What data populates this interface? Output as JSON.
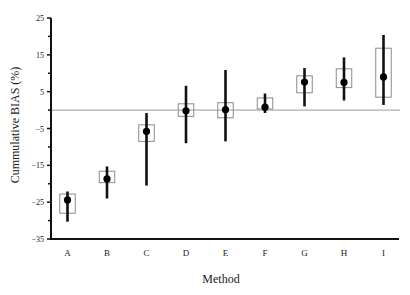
{
  "chart_data": {
    "type": "errorbar-box",
    "title": "",
    "xlabel": "Method",
    "ylabel": "Cummulative BIAS (%)",
    "ylim": [
      -35,
      25
    ],
    "yticks": [
      25,
      15,
      5,
      -5,
      -15,
      -25,
      -35
    ],
    "yticks_minor": [
      20,
      10,
      0,
      -10,
      -20,
      -30
    ],
    "reference_line": 0,
    "grid": false,
    "legend": null,
    "categories": [
      "A",
      "B",
      "C",
      "D",
      "E",
      "F",
      "G",
      "H",
      "I"
    ],
    "series": [
      {
        "name": "Cummulative BIAS",
        "points": [
          {
            "category": "A",
            "mean": -24.4,
            "box_low": -28.0,
            "box_high": -22.8,
            "whisker_low": -30.3,
            "whisker_high": -22.1
          },
          {
            "category": "B",
            "mean": -18.7,
            "box_low": -19.7,
            "box_high": -16.6,
            "whisker_low": -24.0,
            "whisker_high": -15.3
          },
          {
            "category": "C",
            "mean": -5.8,
            "box_low": -8.5,
            "box_high": -4.0,
            "whisker_low": -20.5,
            "whisker_high": -0.8
          },
          {
            "category": "D",
            "mean": -0.2,
            "box_low": -1.7,
            "box_high": 1.7,
            "whisker_low": -9.0,
            "whisker_high": 6.6
          },
          {
            "category": "E",
            "mean": 0.1,
            "box_low": -2.1,
            "box_high": 2.0,
            "whisker_low": -8.5,
            "whisker_high": 10.9
          },
          {
            "category": "F",
            "mean": 0.8,
            "box_low": 0.3,
            "box_high": 3.3,
            "whisker_low": -0.8,
            "whisker_high": 4.5
          },
          {
            "category": "G",
            "mean": 7.6,
            "box_low": 4.7,
            "box_high": 9.3,
            "whisker_low": 1.0,
            "whisker_high": 11.4
          },
          {
            "category": "H",
            "mean": 7.5,
            "box_low": 6.1,
            "box_high": 11.2,
            "whisker_low": 2.6,
            "whisker_high": 14.3
          },
          {
            "category": "I",
            "mean": 9.0,
            "box_low": 3.5,
            "box_high": 16.8,
            "whisker_low": 1.4,
            "whisker_high": 20.4
          }
        ]
      }
    ],
    "colors": {
      "axis": "#111111",
      "box_outline": "#8a8a8a",
      "whisker": "#111111",
      "mean_marker": "#000000",
      "reference_line": "#9a9a9a",
      "text": "#222222"
    }
  }
}
